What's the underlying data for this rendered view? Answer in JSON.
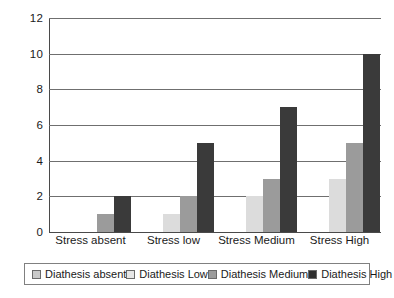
{
  "chart_data": {
    "type": "bar",
    "title": "",
    "subtitle": "",
    "xlabel": "",
    "ylabel": "",
    "ylim": [
      0,
      12
    ],
    "yticks": [
      0,
      2,
      4,
      6,
      8,
      10,
      12
    ],
    "grid": true,
    "legend_position": "bottom",
    "categories": [
      "Stress absent",
      "Stress low",
      "Stress Medium",
      "Stress High"
    ],
    "series": [
      {
        "name": "Diathesis absent",
        "color": "#c9c9c9",
        "values": [
          0,
          0,
          0,
          0
        ]
      },
      {
        "name": "Diathesis Low",
        "color": "#e6e6e6",
        "values": [
          0,
          1,
          2,
          3
        ]
      },
      {
        "name": "Diathesis Medium",
        "color": "#9b9b9b",
        "values": [
          1,
          2,
          3,
          5
        ]
      },
      {
        "name": "Diathesis High",
        "color": "#2f2f2f",
        "values": [
          2,
          5,
          7,
          10
        ]
      }
    ]
  },
  "colors": {
    "background": "#ffffff",
    "axis": "#4a4a4a",
    "gridline": "#6f6f6f",
    "text": "#1a1a1a",
    "legend_border": "#808080"
  }
}
